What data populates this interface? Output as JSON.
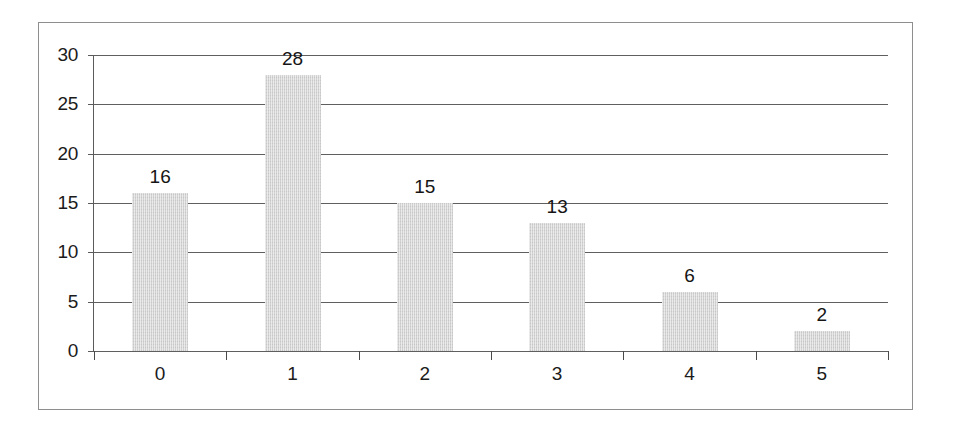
{
  "chart_data": {
    "type": "bar",
    "title": "",
    "subtitle": "",
    "xlabel": "",
    "ylabel": "",
    "categories": [
      "0",
      "1",
      "2",
      "3",
      "4",
      "5"
    ],
    "values": [
      16,
      28,
      15,
      13,
      6,
      2
    ],
    "value_labels": [
      "16",
      "28",
      "15",
      "13",
      "6",
      "2"
    ],
    "ylim": [
      0,
      30
    ],
    "y_ticks": [
      0,
      5,
      10,
      15,
      20,
      25,
      30
    ],
    "y_tick_labels": [
      "0",
      "5",
      "10",
      "15",
      "20",
      "25",
      "30"
    ],
    "x_tick_labels": [
      "0",
      "1",
      "2",
      "3",
      "4",
      "5"
    ],
    "grid": true,
    "grid_axis": "y",
    "legend": false,
    "legend_position": "none",
    "annotations": [],
    "series": [
      {
        "name": "",
        "values": [
          16,
          28,
          15,
          13,
          6,
          2
        ]
      }
    ]
  },
  "style": {
    "bar_fill_color": "#d2d2d2",
    "bar_edge_color": "#c4c4c4",
    "gridline_color": "#5f5f5f",
    "axis_color": "#4a4a4a",
    "text_color": "#1b1b1b",
    "frame_color": "#8e8e8e",
    "background_color": "#ffffff"
  }
}
